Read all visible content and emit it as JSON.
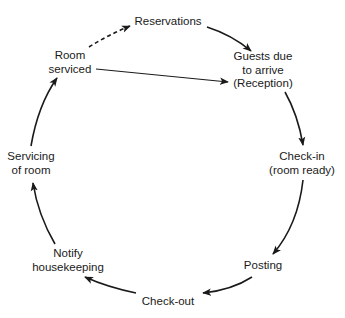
{
  "diagram": {
    "type": "cycle",
    "nodes": {
      "reservations": {
        "lines": [
          "Reservations"
        ]
      },
      "guests_due": {
        "lines": [
          "Guests due",
          "to arrive",
          "(Reception)"
        ]
      },
      "check_in": {
        "lines": [
          "Check-in",
          "(room ready)"
        ]
      },
      "posting": {
        "lines": [
          "Posting"
        ]
      },
      "check_out": {
        "lines": [
          "Check-out"
        ]
      },
      "notify_housekeeping": {
        "lines": [
          "Notify",
          "housekeeping"
        ]
      },
      "servicing_of_room": {
        "lines": [
          "Servicing",
          "of room"
        ]
      },
      "room_serviced": {
        "lines": [
          "Room",
          "serviced"
        ]
      }
    },
    "edges": [
      {
        "from": "Room serviced",
        "to": "Reservations",
        "style": "dashed"
      },
      {
        "from": "Reservations",
        "to": "Guests due to arrive (Reception)",
        "style": "solid"
      },
      {
        "from": "Room serviced",
        "to": "Guests due to arrive (Reception)",
        "style": "solid"
      },
      {
        "from": "Guests due to arrive (Reception)",
        "to": "Check-in (room ready)",
        "style": "solid"
      },
      {
        "from": "Check-in (room ready)",
        "to": "Posting",
        "style": "solid"
      },
      {
        "from": "Posting",
        "to": "Check-out",
        "style": "solid"
      },
      {
        "from": "Check-out",
        "to": "Notify housekeeping",
        "style": "solid"
      },
      {
        "from": "Notify housekeeping",
        "to": "Servicing of room",
        "style": "solid"
      },
      {
        "from": "Servicing of room",
        "to": "Room serviced",
        "style": "solid"
      }
    ],
    "colors": {
      "stroke": "#1a1a1a",
      "background": "#ffffff"
    }
  }
}
